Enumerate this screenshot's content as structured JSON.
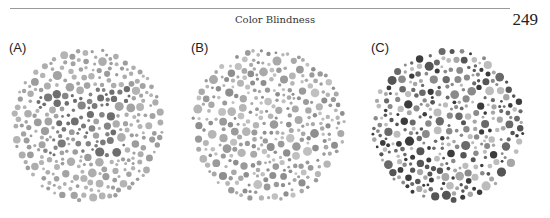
{
  "header": {
    "running_title": "Color Blindness",
    "page_number": "249"
  },
  "figure": {
    "plates": [
      {
        "label": "(A)",
        "center": [
          88,
          125
        ],
        "radius": 78,
        "background_colors": [
          "#a3a3a3",
          "#adadad",
          "#9c9c9c",
          "#b4b4b4"
        ],
        "figure_colors": [
          "#6e6e6e",
          "#7a7a7a",
          "#858585"
        ],
        "description": "Ishihara-style plate with dark-gray dots forming a hidden numeral among lighter gray dots"
      },
      {
        "label": "(B)",
        "center": [
          268,
          125
        ],
        "radius": 78,
        "background_colors": [
          "#a9a9a9",
          "#9a9a9a",
          "#b5b5b5",
          "#8e8e8e",
          "#c0c0c0"
        ],
        "figure_colors": [],
        "description": "Plate with mixed light and mid-gray dots, no evident pattern"
      },
      {
        "label": "(C)",
        "center": [
          448,
          125
        ],
        "radius": 78,
        "background_colors": [
          "#3c3c3c",
          "#555555",
          "#8a8a8a",
          "#a6a6a6",
          "#bcbcbc",
          "#6a6a6a"
        ],
        "figure_colors": [],
        "description": "Plate with high-contrast dark and light gray dots"
      }
    ]
  }
}
